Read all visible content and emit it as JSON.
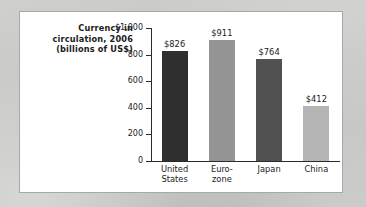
{
  "figure": {
    "title_lines": [
      "Currency in",
      "circulation, 2006",
      "(billions of US$)"
    ],
    "panel_background": "#ffffff",
    "panel_border_color": "#a8a8a6",
    "page_background": "#c9c9c7"
  },
  "chart_data": {
    "type": "bar",
    "title": "Currency in circulation, 2006 (billions of US$)",
    "xlabel": "",
    "ylabel": "",
    "ylim": [
      0,
      1000
    ],
    "grid": false,
    "legend": "none",
    "categories": [
      "United States",
      "Euro-zone",
      "Japan",
      "China"
    ],
    "category_label_lines": [
      [
        "United",
        "States"
      ],
      [
        "Euro-",
        "zone"
      ],
      [
        "Japan",
        ""
      ],
      [
        "China",
        ""
      ]
    ],
    "values": [
      826,
      911,
      764,
      412
    ],
    "value_labels": [
      "$826",
      "$911",
      "$764",
      "$412"
    ],
    "bar_colors": [
      "#2f2f2f",
      "#949494",
      "#515151",
      "#b4b4b4"
    ],
    "y_ticks": [
      1000,
      800,
      600,
      400,
      200,
      0
    ],
    "y_tick_labels": [
      "$1,000",
      "800",
      "600",
      "400",
      "200",
      "0"
    ]
  }
}
